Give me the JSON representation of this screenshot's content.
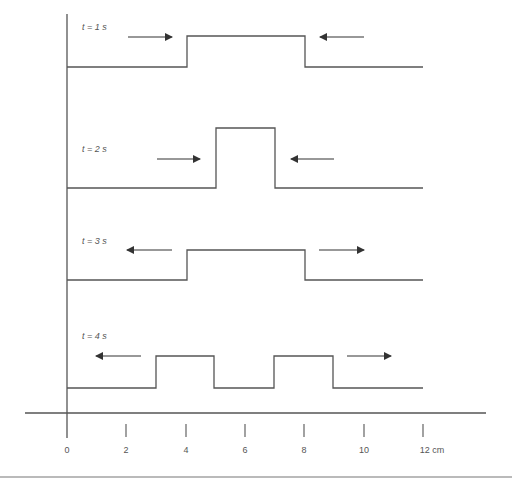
{
  "diagram": {
    "title": "",
    "x_axis": {
      "ticks": [
        "0",
        "2",
        "4",
        "6",
        "8",
        "10",
        "12 cm"
      ],
      "unit": "cm"
    },
    "panels": [
      {
        "label": "t = 1 s",
        "waveform": "single wide pulse from 4 to 8 cm",
        "arrows": [
          "right (toward pulse, left side)",
          "left (toward pulse, right side)"
        ]
      },
      {
        "label": "t = 2 s",
        "waveform": "single tall pulse from 5 to 7 cm",
        "arrows": [
          "right (toward pulse, left side)",
          "left (toward pulse, right side)"
        ]
      },
      {
        "label": "t = 3 s",
        "waveform": "single wide pulse from 4 to 8 cm",
        "arrows": [
          "left (away, left side)",
          "right (away, right side)"
        ]
      },
      {
        "label": "t = 4 s",
        "waveform": "two pulses from 3 to 5 cm and 7 to 9 cm",
        "arrows": [
          "left (away, left side)",
          "right (away, right side)"
        ]
      }
    ],
    "colors": {
      "line": "#555555",
      "arrow": "#333333",
      "text": "#555555"
    }
  },
  "labels": {
    "t1": "t = 1 s",
    "t2": "t = 2 s",
    "t3": "t = 3 s",
    "t4": "t = 4 s",
    "tick0": "0",
    "tick2": "2",
    "tick4": "4",
    "tick6": "6",
    "tick8": "8",
    "tick10": "10",
    "tick12": "12 cm"
  }
}
